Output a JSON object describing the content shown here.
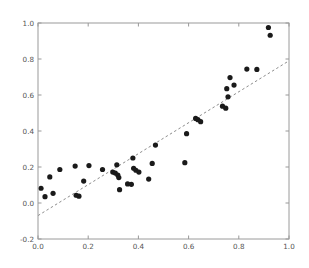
{
  "chart_data": {
    "type": "scatter",
    "title": "",
    "xlabel": "",
    "ylabel": "",
    "xlim": [
      0.0,
      1.0
    ],
    "ylim": [
      -0.2,
      1.0
    ],
    "grid": false,
    "legend": null,
    "xticks": [
      "0.0",
      "0.2",
      "0.4",
      "0.6",
      "0.8",
      "1.0"
    ],
    "xtick_values": [
      0.0,
      0.2,
      0.4,
      0.6,
      0.8,
      1.0
    ],
    "yticks": [
      "-0.2",
      "0.0",
      "0.2",
      "0.4",
      "0.6",
      "0.8",
      "1.0"
    ],
    "ytick_values": [
      -0.2,
      0.0,
      0.2,
      0.4,
      0.6,
      0.8,
      1.0
    ],
    "series": [
      {
        "name": "observations",
        "type": "scatter",
        "marker": "circle",
        "color": "#1a1a1a",
        "marker_size": 3.4,
        "points": [
          [
            0.012,
            0.082
          ],
          [
            0.028,
            0.035
          ],
          [
            0.047,
            0.145
          ],
          [
            0.06,
            0.054
          ],
          [
            0.087,
            0.186
          ],
          [
            0.148,
            0.205
          ],
          [
            0.152,
            0.043
          ],
          [
            0.163,
            0.038
          ],
          [
            0.182,
            0.122
          ],
          [
            0.203,
            0.208
          ],
          [
            0.257,
            0.186
          ],
          [
            0.298,
            0.172
          ],
          [
            0.308,
            0.166
          ],
          [
            0.314,
            0.212
          ],
          [
            0.318,
            0.155
          ],
          [
            0.322,
            0.141
          ],
          [
            0.325,
            0.074
          ],
          [
            0.357,
            0.106
          ],
          [
            0.372,
            0.104
          ],
          [
            0.378,
            0.25
          ],
          [
            0.381,
            0.193
          ],
          [
            0.39,
            0.182
          ],
          [
            0.402,
            0.172
          ],
          [
            0.441,
            0.133
          ],
          [
            0.455,
            0.22
          ],
          [
            0.468,
            0.322
          ],
          [
            0.585,
            0.224
          ],
          [
            0.592,
            0.385
          ],
          [
            0.628,
            0.47
          ],
          [
            0.637,
            0.463
          ],
          [
            0.648,
            0.452
          ],
          [
            0.735,
            0.538
          ],
          [
            0.748,
            0.527
          ],
          [
            0.752,
            0.635
          ],
          [
            0.757,
            0.59
          ],
          [
            0.765,
            0.697
          ],
          [
            0.781,
            0.655
          ],
          [
            0.832,
            0.744
          ],
          [
            0.872,
            0.742
          ],
          [
            0.918,
            0.975
          ],
          [
            0.925,
            0.932
          ]
        ]
      },
      {
        "name": "fit-line",
        "type": "line",
        "style": "dashed",
        "color": "#8c8c8c",
        "x": [
          0.0,
          1.0
        ],
        "y": [
          -0.07,
          0.79
        ]
      }
    ]
  },
  "figure": {
    "background_color": "#ffffff",
    "axes_edge_color": "#999999",
    "tick_color": "#999999",
    "tick_label_color": "#555555"
  }
}
